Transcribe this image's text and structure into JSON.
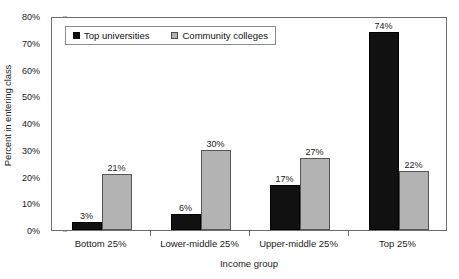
{
  "chart_data": {
    "type": "bar",
    "title": "",
    "xlabel": "Income group",
    "ylabel": "Percent in entering class",
    "categories": [
      "Bottom 25%",
      "Lower-middle 25%",
      "Upper-middle 25%",
      "Top 25%"
    ],
    "series": [
      {
        "name": "Top universities",
        "values": [
          3,
          6,
          17,
          74
        ],
        "color": "#111111"
      },
      {
        "name": "Community colleges",
        "values": [
          21,
          30,
          27,
          22
        ],
        "color": "#b3b3b3"
      }
    ],
    "value_labels": [
      [
        "3%",
        "21%"
      ],
      [
        "6%",
        "30%"
      ],
      [
        "17%",
        "27%"
      ],
      [
        "74%",
        "22%"
      ]
    ],
    "ylim": [
      0,
      80
    ],
    "y_ticks": [
      0,
      10,
      20,
      30,
      40,
      50,
      60,
      70,
      80
    ],
    "y_tick_labels": [
      "0%",
      "10%",
      "20%",
      "30%",
      "40%",
      "50%",
      "60%",
      "70%",
      "80%"
    ],
    "grid": false,
    "legend_position": "top-left"
  }
}
